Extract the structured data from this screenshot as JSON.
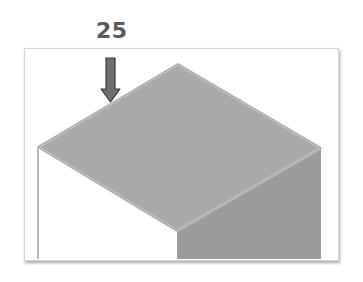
{
  "figure": {
    "label": "25",
    "colors": {
      "top_face": "#a9a9a9",
      "right_face": "#9b9b9b",
      "left_face": "#ffffff",
      "edge_highlight": "#d2d2d2",
      "outline": "#8a8a8a",
      "arrow_fill": "#6e6e6e",
      "arrow_stroke": "#3a3a3a",
      "label_color": "#595959"
    }
  }
}
